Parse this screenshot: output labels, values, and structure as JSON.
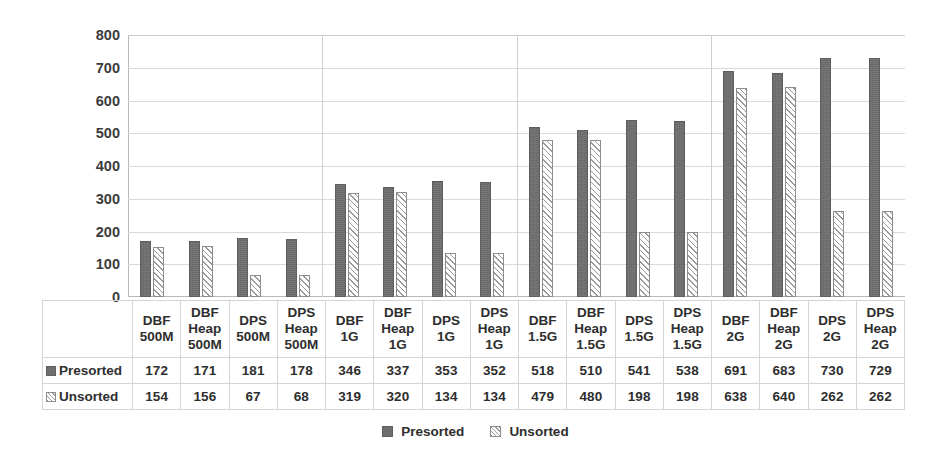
{
  "chart_data": {
    "type": "bar",
    "title": "",
    "xlabel": "",
    "ylabel": "",
    "ylim": [
      0,
      800
    ],
    "ytick_step": 100,
    "yticks": [
      "800",
      "700",
      "600",
      "500",
      "400",
      "300",
      "200",
      "100",
      "0"
    ],
    "grid": "horizontal",
    "legend_position": "bottom",
    "group_separators_after": [
      4,
      8,
      12
    ],
    "categories": [
      "DBF 500M",
      "DBF Heap 500M",
      "DPS 500M",
      "DPS Heap 500M",
      "DBF 1G",
      "DBF Heap 1G",
      "DPS 1G",
      "DPS Heap 1G",
      "DBF 1.5G",
      "DBF Heap 1.5G",
      "DPS 1.5G",
      "DPS Heap 1.5G",
      "DBF 2G",
      "DBF Heap 2G",
      "DPS 2G",
      "DPS Heap 2G"
    ],
    "category_lines": [
      [
        "DBF",
        "500M"
      ],
      [
        "DBF",
        "Heap",
        "500M"
      ],
      [
        "DPS",
        "500M"
      ],
      [
        "DPS",
        "Heap",
        "500M"
      ],
      [
        "DBF",
        "1G"
      ],
      [
        "DBF",
        "Heap",
        "1G"
      ],
      [
        "DPS",
        "1G"
      ],
      [
        "DPS",
        "Heap",
        "1G"
      ],
      [
        "DBF",
        "1.5G"
      ],
      [
        "DBF",
        "Heap",
        "1.5G"
      ],
      [
        "DPS",
        "1.5G"
      ],
      [
        "DPS",
        "Heap",
        "1.5G"
      ],
      [
        "DBF",
        "2G"
      ],
      [
        "DBF",
        "Heap",
        "2G"
      ],
      [
        "DPS",
        "2G"
      ],
      [
        "DPS",
        "Heap",
        "2G"
      ]
    ],
    "series": [
      {
        "name": "Presorted",
        "color": "#6e6e6e",
        "fill": "solid",
        "values": [
          172,
          171,
          181,
          178,
          346,
          337,
          353,
          352,
          518,
          510,
          541,
          538,
          691,
          683,
          730,
          729
        ]
      },
      {
        "name": "Unsorted",
        "color": "#ffffff",
        "fill": "diagonal-hatch",
        "values": [
          154,
          156,
          67,
          68,
          319,
          320,
          134,
          134,
          479,
          480,
          198,
          198,
          638,
          640,
          262,
          262
        ]
      }
    ]
  },
  "legend": {
    "items": [
      {
        "label": "Presorted"
      },
      {
        "label": "Unsorted"
      }
    ]
  },
  "data_table": {
    "corner_label": "",
    "rows": [
      {
        "label": "Presorted",
        "values": [
          "172",
          "171",
          "181",
          "178",
          "346",
          "337",
          "353",
          "352",
          "518",
          "510",
          "541",
          "538",
          "691",
          "683",
          "730",
          "729"
        ]
      },
      {
        "label": "Unsorted",
        "values": [
          "154",
          "156",
          "67",
          "68",
          "319",
          "320",
          "134",
          "134",
          "479",
          "480",
          "198",
          "198",
          "638",
          "640",
          "262",
          "262"
        ]
      }
    ]
  }
}
